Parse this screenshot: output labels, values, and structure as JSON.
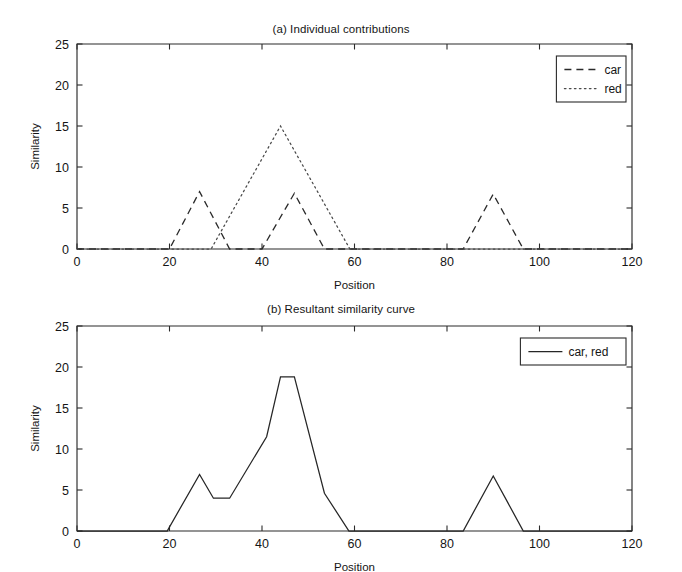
{
  "figure": {
    "width": 682,
    "height": 572,
    "background": "#ffffff",
    "line_color": "#2a2a2a"
  },
  "chart_data": [
    {
      "id": "panel-a",
      "type": "line",
      "title": "(a) Individual contributions",
      "xlabel": "Position",
      "ylabel": "Similarity",
      "xlim": [
        0,
        120
      ],
      "ylim": [
        0,
        25
      ],
      "xticks": [
        0,
        20,
        40,
        60,
        80,
        100,
        120
      ],
      "yticks": [
        0,
        5,
        10,
        15,
        20,
        25
      ],
      "grid": false,
      "legend_position": "upper right",
      "series": [
        {
          "name": "car",
          "style": "dashed",
          "x": [
            0,
            20,
            26.5,
            33,
            40,
            47,
            53.5,
            83.5,
            90,
            96.5,
            120
          ],
          "y": [
            0,
            0,
            7.0,
            0,
            0,
            6.8,
            0,
            0,
            6.7,
            0,
            0
          ]
        },
        {
          "name": "red",
          "style": "dotted",
          "x": [
            0,
            29,
            44,
            59,
            120
          ],
          "y": [
            0,
            0,
            15.0,
            0,
            0
          ]
        }
      ]
    },
    {
      "id": "panel-b",
      "type": "line",
      "title": "(b) Resultant similarity curve",
      "xlabel": "Position",
      "ylabel": "Similarity",
      "xlim": [
        0,
        120
      ],
      "ylim": [
        0,
        25
      ],
      "xticks": [
        0,
        20,
        40,
        60,
        80,
        100,
        120
      ],
      "yticks": [
        0,
        5,
        10,
        15,
        20,
        25
      ],
      "grid": false,
      "legend_position": "upper right",
      "series": [
        {
          "name": "car, red",
          "style": "solid",
          "x": [
            0,
            19.5,
            26.5,
            29.5,
            33,
            41,
            44,
            47,
            53.5,
            58.8,
            83.5,
            90,
            96.5,
            120
          ],
          "y": [
            0,
            0,
            6.9,
            4.0,
            4.0,
            11.5,
            18.8,
            18.8,
            4.6,
            0,
            0,
            6.7,
            0,
            0
          ]
        }
      ]
    }
  ],
  "panel_a": {
    "title": "(a) Individual contributions",
    "xlabel": "Position",
    "ylabel": "Similarity",
    "xticklabels": [
      "0",
      "20",
      "40",
      "60",
      "80",
      "100",
      "120"
    ],
    "yticklabels": [
      "0",
      "5",
      "10",
      "15",
      "20",
      "25"
    ],
    "legend": [
      {
        "label": "car",
        "style": "dashed"
      },
      {
        "label": "red",
        "style": "dotted"
      }
    ]
  },
  "panel_b": {
    "title": "(b) Resultant similarity curve",
    "xlabel": "Position",
    "ylabel": "Similarity",
    "xticklabels": [
      "0",
      "20",
      "40",
      "60",
      "80",
      "100",
      "120"
    ],
    "yticklabels": [
      "0",
      "5",
      "10",
      "15",
      "20",
      "25"
    ],
    "legend": [
      {
        "label": "car, red",
        "style": "solid"
      }
    ]
  }
}
